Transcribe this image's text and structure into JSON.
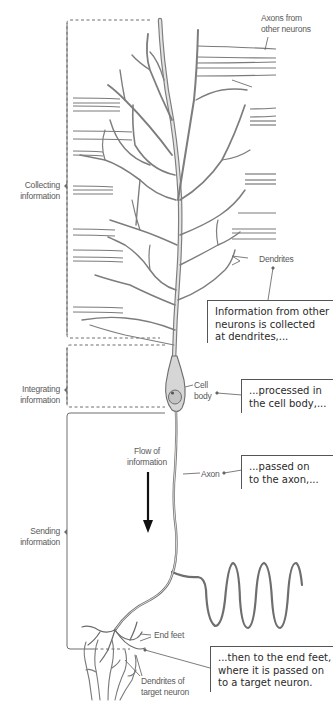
{
  "figure": {
    "type": "neuron-information-flow-diagram",
    "colors": {
      "line": "#6e6e6e",
      "neuron_fill": "#d9d9d9",
      "text": "#2a2a2a",
      "label": "#5a5a5a",
      "arrow": "#111111"
    }
  },
  "stages": [
    {
      "id": "collecting",
      "line1": "Collecting",
      "line2": "information"
    },
    {
      "id": "integrating",
      "line1": "Integrating",
      "line2": "information"
    },
    {
      "id": "sending",
      "line1": "Sending",
      "line2": "information"
    }
  ],
  "labels": {
    "axons_from_other": {
      "line1": "Axons from",
      "line2": "other neurons"
    },
    "dendrites": "Dendrites",
    "cell_body": {
      "line1": "Cell",
      "line2": "body"
    },
    "axon": "Axon",
    "flow": {
      "line1": "Flow of",
      "line2": "information"
    },
    "end_feet": "End feet",
    "target_dendrites": {
      "line1": "Dendrites of",
      "line2": "target neuron"
    }
  },
  "callouts": [
    {
      "id": "collected",
      "lines": [
        "Information from other",
        "neurons is collected",
        "at dendrites,..."
      ]
    },
    {
      "id": "processed",
      "lines": [
        "...processed in",
        "the cell body,..."
      ]
    },
    {
      "id": "passed",
      "lines": [
        "...passed on",
        "to the axon,..."
      ]
    },
    {
      "id": "end_feet",
      "lines": [
        "...then to the end feet,",
        "where it is passed on",
        "to a target neuron."
      ]
    }
  ]
}
